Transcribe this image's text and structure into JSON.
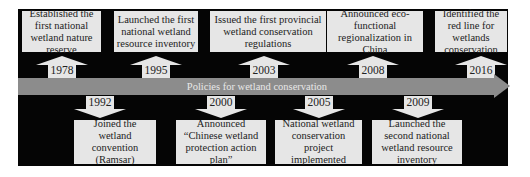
{
  "diagram": {
    "type": "timeline",
    "axis_label": "Policies for wetland conservation",
    "colors": {
      "background": "#050505",
      "box": "#e6e6e6",
      "band": "#8c8c8c",
      "band_text": "#e8e8e8",
      "text": "#222222"
    },
    "above": [
      {
        "year": "1978",
        "text": "Established the first national wetland nature reserve"
      },
      {
        "year": "1995",
        "text": "Launched the first national wetland resource inventory"
      },
      {
        "year": "2003",
        "text": "Issued the first provincial wetland conservation regulations"
      },
      {
        "year": "2008",
        "text": "Announced eco-functional regionalization in China"
      },
      {
        "year": "2016",
        "text": "Identified the red line for wetlands conservation"
      }
    ],
    "below": [
      {
        "year": "1992",
        "text": "Joined the wetland convention (Ramsar)"
      },
      {
        "year": "2000",
        "text": "Announced “Chinese wetland protection action plan”"
      },
      {
        "year": "2005",
        "text": "National wetland conservation project implemented"
      },
      {
        "year": "2009",
        "text": "Launched the second national wetland resource inventory"
      }
    ]
  }
}
